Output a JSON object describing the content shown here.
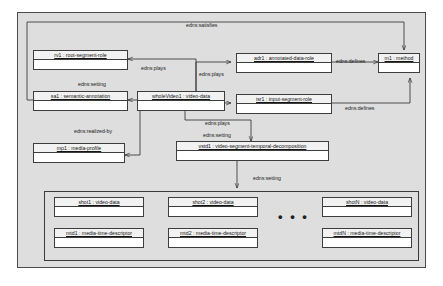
{
  "diagram": {
    "frame_fill": "#dedede",
    "box_fill": "#f2f2f2",
    "line_color": "#2a2a2a",
    "ellipsis": "• • •"
  },
  "objects": [
    {
      "id": "rv1",
      "label": "rv1 : root-segment-role"
    },
    {
      "id": "sa1",
      "label": "sa1 : semantic-annotation"
    },
    {
      "id": "wholeVideo1",
      "label": "wholeVideo1 : video-data"
    },
    {
      "id": "adr1",
      "label": "adr1 : annotated-data-role"
    },
    {
      "id": "isr1",
      "label": "isr1 : input-segment-role"
    },
    {
      "id": "m1",
      "label": "m1 : method"
    },
    {
      "id": "mp1",
      "label": "mp1 : media-profile"
    },
    {
      "id": "vstd1",
      "label": "vstd1 : video-segment-temporal-decomposition"
    },
    {
      "id": "shot1",
      "label": "shot1 : video-data"
    },
    {
      "id": "shot2",
      "label": "shot2 : video-data"
    },
    {
      "id": "shotN",
      "label": "shotN : video-data"
    },
    {
      "id": "mtd1",
      "label": "mtd1 : media-time-descriptor"
    },
    {
      "id": "mtd2",
      "label": "mtd2 : media-time-descriptor"
    },
    {
      "id": "mtdN",
      "label": "mtdN : media-time-descriptor"
    }
  ],
  "edge_labels": {
    "satisfies": "edns:satisfies",
    "plays_rv1": "edns:plays",
    "plays_adr1": "edns:plays",
    "setting_sa1": "edns:setting",
    "defines_adr1": "edns:defines",
    "defines_isr1": "edns:defines",
    "plays_isr1": "edns:plays",
    "realized_by": "edns:realized-by",
    "setting_vstd1": "edns:setting",
    "setting_shots": "edns:setting"
  }
}
